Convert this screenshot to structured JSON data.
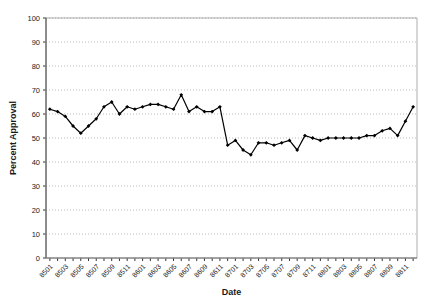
{
  "chart_data": {
    "type": "line",
    "title": "",
    "xlabel": "Date",
    "ylabel": "Percent Approval",
    "ylim": [
      0,
      100
    ],
    "ytick_step": 10,
    "yticks": [
      0,
      10,
      20,
      30,
      40,
      50,
      60,
      70,
      80,
      90,
      100
    ],
    "grid": "horizontal-dotted",
    "legend": "none",
    "line_color": "#000000",
    "marker": "diamond",
    "marker_color": "#000000",
    "x": [
      "8501",
      "8502",
      "8503",
      "8504",
      "8505",
      "8506",
      "8507",
      "8508",
      "8509",
      "8510",
      "8511",
      "8512",
      "8601",
      "8602",
      "8603",
      "8604",
      "8605",
      "8606",
      "8607",
      "8608",
      "8609",
      "8610",
      "8611",
      "8612",
      "8701",
      "8702",
      "8703",
      "8704",
      "8705",
      "8706",
      "8707",
      "8708",
      "8709",
      "8710",
      "8711",
      "8712",
      "8801",
      "8802",
      "8803",
      "8804",
      "8805",
      "8806",
      "8807",
      "8808",
      "8809",
      "8810",
      "8811",
      "8812"
    ],
    "xtick_labels": [
      "8501",
      "8503",
      "8505",
      "8507",
      "8509",
      "8511",
      "8601",
      "8603",
      "8605",
      "8607",
      "8609",
      "8611",
      "8701",
      "8703",
      "8705",
      "8707",
      "8709",
      "8711",
      "8801",
      "8803",
      "8805",
      "8807",
      "8809",
      "8811"
    ],
    "values": [
      62,
      61,
      59,
      55,
      52,
      55,
      58,
      63,
      65,
      60,
      63,
      62,
      63,
      64,
      64,
      63,
      62,
      68,
      61,
      63,
      61,
      61,
      63,
      47,
      49,
      45,
      43,
      48,
      48,
      47,
      48,
      49,
      45,
      51,
      50,
      49,
      50,
      50,
      50,
      50,
      50,
      51,
      51,
      53,
      54,
      51,
      57,
      63
    ]
  }
}
